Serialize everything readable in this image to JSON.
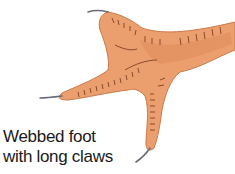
{
  "illustration": {
    "subject": "webbed foot with long claws",
    "colors": {
      "skin": "#ec9f6e",
      "skin_shade": "#d9824f",
      "scale_lines": "#8a4a2a",
      "claw": "#6b6b78"
    }
  },
  "caption": {
    "line1": "Webbed foot",
    "line2": "with long claws"
  }
}
